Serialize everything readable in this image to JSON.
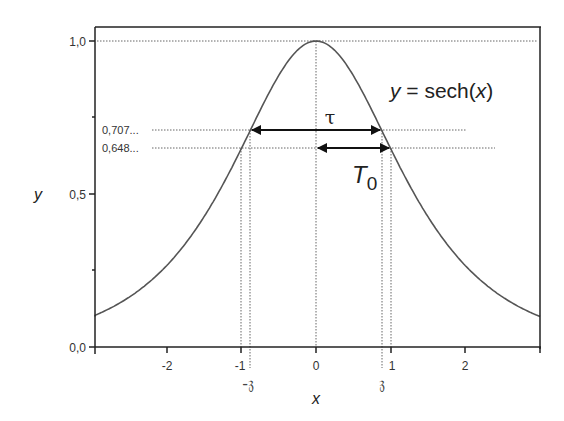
{
  "chart_data": {
    "type": "line",
    "title": "",
    "xlabel": "x",
    "ylabel": "y",
    "xlim": [
      -3,
      3
    ],
    "ylim": [
      0,
      1.0
    ],
    "grid": false,
    "legend": null,
    "x_ticks": [
      -2,
      -1,
      0,
      1,
      2
    ],
    "x_tick_labels": [
      "-2",
      "-1",
      "0",
      "1",
      "2"
    ],
    "y_ticks": [
      0.0,
      0.5,
      1.0
    ],
    "y_tick_labels": [
      "0,0",
      "0,5",
      "1,0"
    ],
    "series": [
      {
        "name": "y = sech(x)",
        "function": "sech(x)",
        "x": [
          -3,
          -2.5,
          -2,
          -1.5,
          -1,
          -0.5,
          0,
          0.5,
          1,
          1.5,
          2,
          2.5,
          3
        ],
        "values": [
          0.099,
          0.163,
          0.266,
          0.425,
          0.648,
          0.887,
          1.0,
          0.887,
          0.648,
          0.425,
          0.266,
          0.163,
          0.099
        ]
      }
    ],
    "annotations": [
      {
        "type": "text",
        "text": "y = sech(x)",
        "position": "upper right"
      },
      {
        "type": "hline_dotted",
        "y": 1.0,
        "label": "1,0"
      },
      {
        "type": "hline_dotted",
        "y": 0.707,
        "label": "0,707..."
      },
      {
        "type": "hline_dotted",
        "y": 0.648,
        "label": "0,648..."
      },
      {
        "type": "vline_dotted",
        "x": 0
      },
      {
        "type": "vline_dotted",
        "x": -1
      },
      {
        "type": "vline_dotted",
        "x": 1
      },
      {
        "type": "vline_dotted",
        "x": -0.8814,
        "label": "-𝔷"
      },
      {
        "type": "vline_dotted",
        "x": 0.8814,
        "label": "𝔷"
      },
      {
        "type": "double_arrow",
        "from_x": -0.8814,
        "to_x": 0.8814,
        "y": 0.707,
        "label": "τ"
      },
      {
        "type": "double_arrow",
        "from_x": 0,
        "to_x": 1,
        "y": 0.648,
        "label": "T0"
      }
    ]
  },
  "labels": {
    "function_label_y": "y",
    "function_label_eq": " = sech(",
    "function_label_x": "x",
    "function_label_close": ")",
    "level_707": "0,707...",
    "level_648": "0,648...",
    "tau": "τ",
    "T0_main": "T",
    "T0_sub": "0",
    "neg_z": "-𝔷",
    "pos_z": "𝔷",
    "x_axis_title": "x",
    "y_axis_title": "y",
    "y_tick_0": "0,0",
    "y_tick_05": "0,5",
    "y_tick_1": "1,0",
    "x_tick_m2": "-2",
    "x_tick_m1": "-1",
    "x_tick_0": "0",
    "x_tick_1": "1",
    "x_tick_2": "2"
  },
  "colors": {
    "axis": "#222222",
    "curve": "#555555",
    "dotted": "#666666",
    "arrow": "#111111"
  }
}
